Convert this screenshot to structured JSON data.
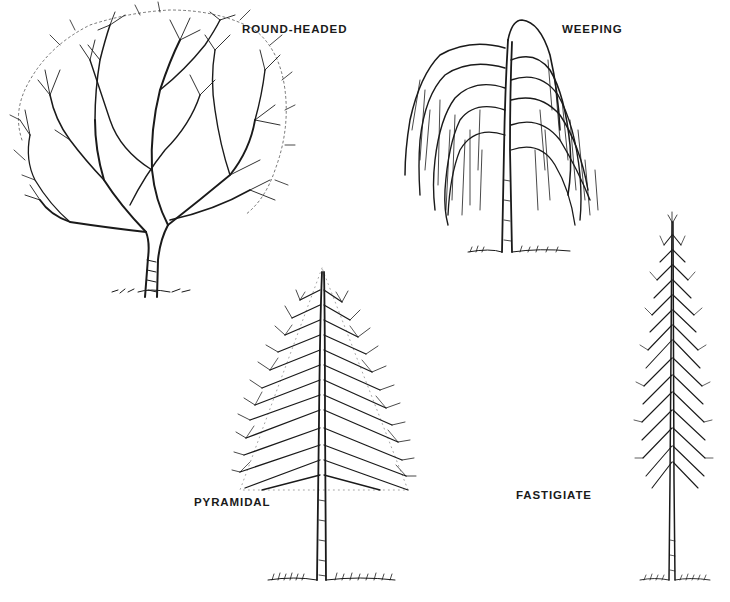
{
  "figure": {
    "labels": {
      "round_headed": "ROUND-HEADED",
      "weeping": "WEEPING",
      "pyramidal": "PYRAMIDAL",
      "fastigiate": "FASTIGIATE"
    },
    "ink_color": "#1a1a1a",
    "background": "#ffffff"
  }
}
